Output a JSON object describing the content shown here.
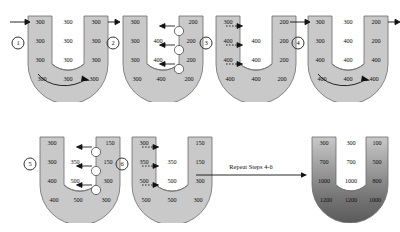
{
  "diagram": {
    "repeat_note": "Repeat Steps 4-6",
    "colors": {
      "tube_fill": "#c9c9c9",
      "tube_stroke": "#6b6b6b",
      "interstitium_fill": "#ffffff",
      "text": "#111111",
      "arrow": "#111111",
      "gradient_top": "#c9c9c9",
      "gradient_bottom": "#5a5a5a"
    },
    "panels": [
      {
        "id": "panel-1",
        "step_label": "1",
        "descending_limb": [
          "300",
          "300",
          "300",
          "300"
        ],
        "interstitium": [
          "300",
          "300",
          "300",
          "300"
        ],
        "ascending_limb": [
          "300",
          "300",
          "300",
          "300"
        ],
        "inflow_arrow": true,
        "outflow_arrow": true,
        "flow_arrow_bottom": true,
        "pump_markers": [],
        "diffusion_arrows": []
      },
      {
        "id": "panel-2",
        "step_label": "2",
        "descending_limb": [
          "300",
          "300",
          "300",
          "300"
        ],
        "interstitium": [
          "",
          "400",
          "400",
          "400"
        ],
        "ascending_limb": [
          "200",
          "200",
          "200",
          "200"
        ],
        "inflow_arrow": false,
        "outflow_arrow": false,
        "flow_arrow_bottom": false,
        "pump_markers": [
          "pump",
          "pump",
          "pump"
        ],
        "diffusion_arrows": [
          "left",
          "left",
          "left"
        ]
      },
      {
        "id": "panel-3",
        "step_label": "3",
        "descending_limb": [
          "300",
          "400",
          "400",
          "400"
        ],
        "interstitium": [
          "",
          "400",
          "400",
          "400"
        ],
        "ascending_limb": [
          "200",
          "200",
          "200",
          "200"
        ],
        "inflow_arrow": false,
        "outflow_arrow": false,
        "flow_arrow_bottom": false,
        "pump_markers": [],
        "diffusion_arrows": [
          "right",
          "right",
          "right"
        ]
      },
      {
        "id": "panel-4",
        "step_label": "4",
        "descending_limb": [
          "300",
          "300",
          "400",
          "400"
        ],
        "interstitium": [
          "300",
          "400",
          "400",
          "400"
        ],
        "ascending_limb": [
          "200",
          "200",
          "400",
          "400"
        ],
        "inflow_arrow": true,
        "outflow_arrow": true,
        "flow_arrow_bottom": true,
        "pump_markers": [],
        "diffusion_arrows": []
      },
      {
        "id": "panel-5",
        "step_label": "5",
        "descending_limb": [
          "300",
          "300",
          "400",
          "400"
        ],
        "interstitium": [
          "",
          "350",
          "500",
          "500"
        ],
        "ascending_limb": [
          "150",
          "150",
          "300",
          "300"
        ],
        "inflow_arrow": false,
        "outflow_arrow": false,
        "flow_arrow_bottom": false,
        "pump_markers": [
          "pump",
          "pump",
          "pump"
        ],
        "diffusion_arrows": [
          "left",
          "left",
          "left"
        ]
      },
      {
        "id": "panel-6",
        "step_label": "6",
        "descending_limb": [
          "300",
          "350",
          "500",
          "500"
        ],
        "interstitium": [
          "",
          "350",
          "500",
          "500"
        ],
        "ascending_limb": [
          "150",
          "150",
          "300",
          "300"
        ],
        "inflow_arrow": false,
        "outflow_arrow": false,
        "flow_arrow_bottom": false,
        "pump_markers": [],
        "diffusion_arrows": [
          "right",
          "right",
          "right"
        ]
      },
      {
        "id": "panel-final",
        "step_label": "",
        "descending_limb": [
          "300",
          "700",
          "1000",
          "1200"
        ],
        "interstitium": [
          "300",
          "700",
          "1000",
          "1200"
        ],
        "ascending_limb": [
          "100",
          "500",
          "800",
          "1000"
        ],
        "inflow_arrow": false,
        "outflow_arrow": false,
        "flow_arrow_bottom": false,
        "pump_markers": [],
        "diffusion_arrows": [],
        "gradient": true
      }
    ]
  }
}
